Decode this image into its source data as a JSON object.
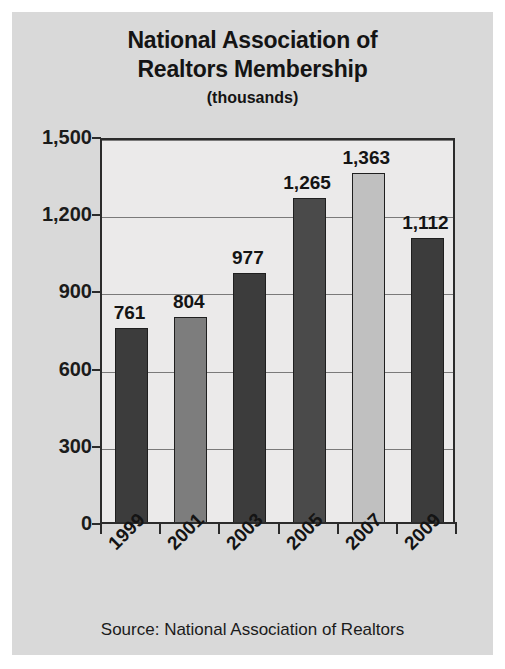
{
  "figure": {
    "title_line1": "National Association of",
    "title_line2": "Realtors Membership",
    "subtitle": "(thousands)",
    "source": "Source: National Association of Realtors",
    "background_color": "#d9d9d9",
    "plot_background_color": "#ebeaea",
    "axis_color": "#2b2b2b",
    "gridline_color": "#7a7a7a"
  },
  "chart_data": {
    "type": "bar",
    "title": "National Association of Realtors Membership (thousands)",
    "xlabel": "",
    "ylabel": "",
    "ylim": [
      0,
      1500
    ],
    "yticks": [
      0,
      300,
      600,
      900,
      1200,
      1500
    ],
    "ytick_labels": [
      "0",
      "300",
      "600",
      "900",
      "1,200",
      "1,500"
    ],
    "grid": true,
    "legend": "none",
    "categories": [
      "1999",
      "2001",
      "2003",
      "2005",
      "2007",
      "2009"
    ],
    "values": [
      761,
      804,
      977,
      1265,
      1363,
      1112
    ],
    "value_labels": [
      "761",
      "804",
      "977",
      "1,265",
      "1,363",
      "1,112"
    ],
    "bar_colors": [
      "#3c3c3c",
      "#7d7d7d",
      "#3c3c3c",
      "#4a4a4a",
      "#c0c0c0",
      "#3c3c3c"
    ],
    "source": "Source: National Association of Realtors"
  }
}
